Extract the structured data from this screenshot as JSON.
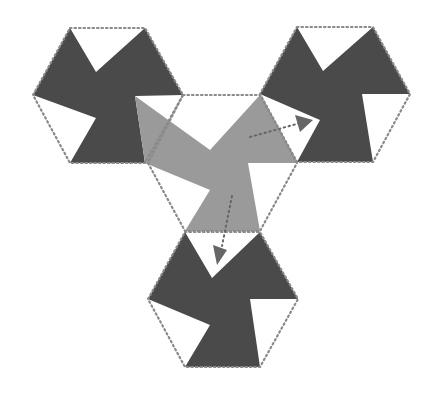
{
  "diagram": {
    "title": "",
    "colors": {
      "background": "#ffffff",
      "dark_piece": "#4a4a4a",
      "light_piece": "#9a9a9a",
      "outline": "#8a8a8a",
      "arrow": "#666666"
    },
    "hexagons": [
      {
        "id": "top-left",
        "points": "70,28 145,28 183,95 145,163 70,163 33,95"
      },
      {
        "id": "top-right",
        "points": "297,27 373,27 410,94 373,162 297,162 260,94"
      },
      {
        "id": "center",
        "points": "183,95 260,95 297,163 260,231 185,231 148,163"
      },
      {
        "id": "bottom",
        "points": "185,232 260,232 298,299 260,367 185,367 148,299"
      }
    ],
    "pieces": [
      {
        "id": "top-left-dark",
        "shade": "dark",
        "points": "70,28 96,72 145,28 183,95 135,96 145,163 70,163 96,118 33,95"
      },
      {
        "id": "top-right-dark",
        "shade": "dark",
        "points": "297,27 323,71 373,27 410,94 362,94 373,162 297,162 320,120 260,94"
      },
      {
        "id": "center-light",
        "shade": "light",
        "points": "135,96 210,150 260,95 297,163 248,163 260,231 185,231 210,190 145,163"
      },
      {
        "id": "bottom-dark",
        "shade": "dark",
        "points": "185,232 212,278 260,232 298,299 250,299 260,367 185,367 210,325 148,299"
      }
    ],
    "arrows": [
      {
        "id": "arrow-to-right",
        "path": "M 250,137 L 300,123",
        "head": "295,115 313,120 300,132"
      },
      {
        "id": "arrow-to-bottom",
        "path": "M 232,196 L 222,246",
        "head": "213,245 227,250 217,265"
      }
    ]
  }
}
